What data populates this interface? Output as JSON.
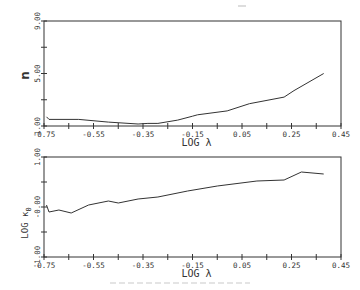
{
  "chart_data": [
    {
      "type": "line",
      "title": "",
      "xlabel": "LOG λ",
      "ylabel": "n",
      "xlim": [
        -0.75,
        0.45
      ],
      "ylim": [
        1.0,
        9.0
      ],
      "x_ticks": [
        "-0.75",
        "-0.55",
        "-0.35",
        "-0.15",
        "0.05",
        "0.25",
        "0.45"
      ],
      "y_ticks": [
        "1.00",
        "5.00",
        "9.00"
      ],
      "grid": false,
      "series": [
        {
          "name": "n",
          "x": [
            -0.74,
            -0.73,
            -0.61,
            -0.49,
            -0.37,
            -0.33,
            -0.29,
            -0.21,
            -0.15,
            -0.13,
            -0.01,
            0.08,
            0.22,
            0.26,
            0.38
          ],
          "y": [
            1.7,
            1.5,
            1.5,
            1.3,
            1.15,
            1.2,
            1.2,
            1.45,
            1.75,
            1.85,
            2.15,
            2.7,
            3.2,
            3.7,
            5.0
          ]
        }
      ]
    },
    {
      "type": "line",
      "title": "",
      "xlabel": "LOG λ",
      "ylabel": "LOG κ₀",
      "xlim": [
        -0.75,
        0.45
      ],
      "ylim": [
        -1.0,
        1.0
      ],
      "x_ticks": [
        "-0.75",
        "-0.55",
        "-0.35",
        "-0.15",
        "0.05",
        "0.25",
        "0.45"
      ],
      "y_ticks": [
        "-1.00",
        "-0.00",
        "1.00"
      ],
      "grid": false,
      "series": [
        {
          "name": "log kappa",
          "x": [
            -0.74,
            -0.73,
            -0.69,
            -0.64,
            -0.57,
            -0.49,
            -0.45,
            -0.37,
            -0.29,
            -0.17,
            -0.05,
            0.11,
            0.22,
            0.29,
            0.38
          ],
          "y": [
            0.04,
            -0.1,
            -0.06,
            -0.12,
            0.04,
            0.12,
            0.08,
            0.16,
            0.2,
            0.32,
            0.42,
            0.52,
            0.54,
            0.7,
            0.66
          ]
        }
      ]
    }
  ],
  "plots": {
    "top": {
      "ylabel": "n",
      "xlabel": "LOG λ"
    },
    "bottom": {
      "ylabel_main": "LOG κ",
      "ylabel_sub": "0",
      "xlabel": "LOG λ"
    }
  }
}
